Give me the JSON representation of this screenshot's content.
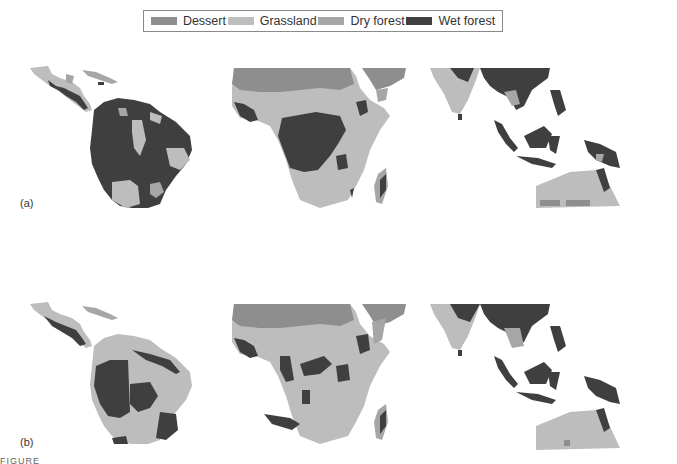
{
  "legend": {
    "items": [
      {
        "label": "Dessert",
        "color": "#8e8e8e"
      },
      {
        "label": "Grassland",
        "color": "#bdbdbd"
      },
      {
        "label": "Dry forest",
        "color": "#a6a6a6"
      },
      {
        "label": "Wet forest",
        "color": "#3f3f3f"
      }
    ]
  },
  "panels": [
    {
      "label": "(a)",
      "regions": [
        "Central & South America",
        "Africa",
        "South & Southeast Asia / Australia"
      ]
    },
    {
      "label": "(b)",
      "regions": [
        "Central & South America",
        "Africa",
        "South & Southeast Asia / Australia"
      ]
    }
  ],
  "colors": {
    "desert": "#8e8e8e",
    "grassland": "#bdbdbd",
    "dry_forest": "#a6a6a6",
    "wet_forest": "#3f3f3f"
  },
  "caption_fragment": "FIGURE 20.12"
}
